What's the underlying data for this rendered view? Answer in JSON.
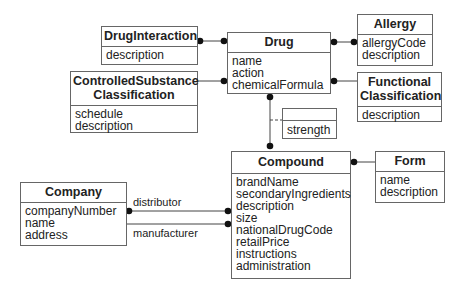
{
  "classes": {
    "drug_interaction": {
      "name": "DrugInteraction",
      "attributes": [
        "description"
      ]
    },
    "controlled_substance": {
      "name_line1": "ControlledSubstance",
      "name_line2": "Classification",
      "attributes": [
        "schedule",
        "description"
      ]
    },
    "drug": {
      "name": "Drug",
      "attributes": [
        "name",
        "action",
        "chemicalFormula"
      ]
    },
    "allergy": {
      "name": "Allergy",
      "attributes": [
        "allergyCode",
        "description"
      ]
    },
    "functional": {
      "name_line1": "Functional",
      "name_line2": "Classification",
      "attributes": [
        "description"
      ]
    },
    "strength": {
      "name": "",
      "attributes": [
        "strength"
      ]
    },
    "compound": {
      "name": "Compound",
      "attributes": [
        "brandName",
        "secondaryIngredients",
        "description",
        "size",
        "nationalDrugCode",
        "retailPrice",
        "instructions",
        "administration"
      ]
    },
    "form": {
      "name": "Form",
      "attributes": [
        "name",
        "description"
      ]
    },
    "company": {
      "name": "Company",
      "attributes": [
        "companyNumber",
        "name",
        "address"
      ]
    }
  },
  "associations": {
    "distributor": "distributor",
    "manufacturer": "manufacturer"
  }
}
